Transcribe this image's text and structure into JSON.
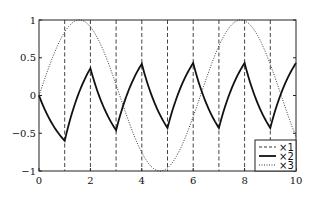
{
  "chart_data": {
    "type": "line",
    "title": "",
    "xlabel": "",
    "ylabel": "",
    "xlim": [
      0,
      10
    ],
    "ylim": [
      -1,
      1
    ],
    "grid": false,
    "legend_position": "lower right",
    "x_ticks": [
      0,
      2,
      4,
      6,
      8,
      10
    ],
    "x_tick_labels": [
      "0",
      "2",
      "4",
      "6",
      "8",
      "10"
    ],
    "y_ticks": [
      1,
      0.5,
      0,
      -0.5,
      -1
    ],
    "y_tick_labels": [
      "1",
      "0.5",
      "0",
      "−0.5",
      "−1"
    ],
    "series": [
      {
        "name": "×1",
        "style": "dashed",
        "description": "vertical dashed lines at sampling instants",
        "x_positions": [
          1,
          2,
          3,
          4,
          5,
          6,
          7,
          8,
          9
        ]
      },
      {
        "name": "×2",
        "style": "solid",
        "description": "switching first-order response, extrema at integer times",
        "x": [
          0,
          1,
          2,
          3,
          4,
          5,
          6,
          7,
          8,
          9,
          10
        ],
        "y": [
          0,
          -0.6,
          0.36,
          -0.46,
          0.42,
          -0.43,
          0.43,
          -0.43,
          0.43,
          -0.43,
          0.43
        ]
      },
      {
        "name": "×3",
        "style": "dotted",
        "description": "sin(t)",
        "x": [
          0,
          1.57,
          3.14,
          4.71,
          6.28,
          7.85,
          9.42,
          10
        ],
        "y": [
          0,
          1,
          0,
          -1,
          0,
          1,
          0,
          -0.54
        ]
      }
    ]
  },
  "legend": {
    "items": [
      {
        "label": "×1",
        "style": "dashed"
      },
      {
        "label": "×2",
        "style": "solid"
      },
      {
        "label": "×3",
        "style": "dotted"
      }
    ]
  }
}
